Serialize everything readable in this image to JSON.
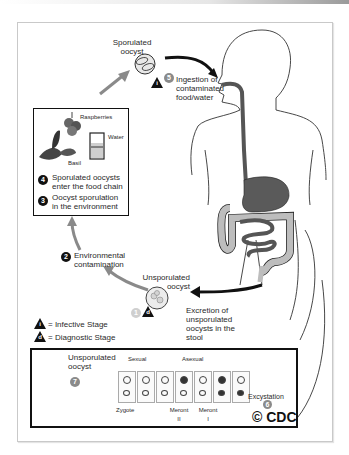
{
  "diagram": {
    "credit": "© CDC",
    "labels": {
      "sporulated_oocyst": "Sporulated oocyst",
      "ingestion": "Ingestion of contaminated food/water",
      "raspberries": "Raspberries",
      "water": "Water",
      "basil": "Basil",
      "enter_food_chain": "Sporulated oocysts enter the food chain",
      "sporulation_env": "Oocyst sporulation in the environment",
      "env_contamination": "Environmental contamination",
      "unsporulated_oocyst_top": "Unsporulated oocyst",
      "excretion": "Excretion of unsporulated oocysts in the stool",
      "unsporulated_oocyst_bottom": "Unsporulated oocyst",
      "sexual": "Sexual",
      "asexual": "Asexual",
      "zygote": "Zygote",
      "meront_ii": "Meront II",
      "meront_i": "Meront I",
      "excystation": "Excystation"
    },
    "legend": [
      {
        "symbol": "i",
        "text": "= Infective Stage"
      },
      {
        "symbol": "d",
        "text": "= Diagnostic Stage"
      }
    ],
    "steps": [
      {
        "number": "1",
        "text": "Excretion of unsporulated oocysts in the stool"
      },
      {
        "number": "2",
        "text": "Environmental contamination"
      },
      {
        "number": "3",
        "text": "Oocyst sporulation in the environment"
      },
      {
        "number": "4",
        "text": "Sporulated oocysts enter the food chain"
      },
      {
        "number": "5",
        "text": "Ingestion of contaminated food/water"
      },
      {
        "number": "6",
        "text": "Excystation"
      },
      {
        "number": "7",
        "text": "Unsporulated oocyst"
      }
    ],
    "colors": {
      "arrow_grey": "#8a8a8a",
      "arrow_black": "#111111",
      "gut_dark": "#5a5a5a",
      "gut_light": "#b8b8b8"
    }
  }
}
